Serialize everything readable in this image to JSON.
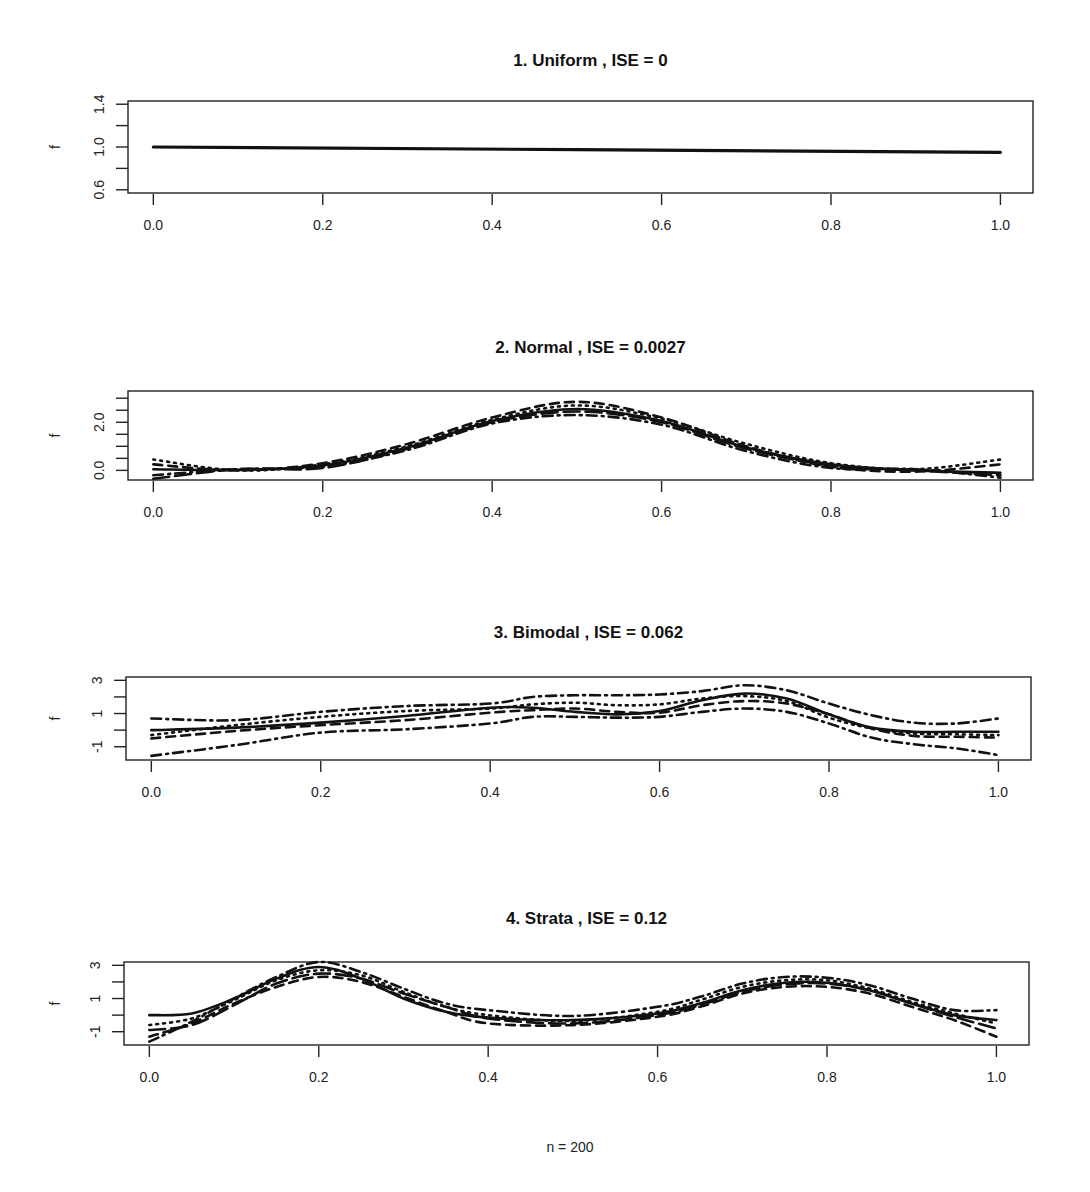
{
  "figure": {
    "footer": "n  =  200",
    "colors": {
      "line": "#111111",
      "frame": "#222222",
      "background": "#ffffff"
    }
  },
  "chart_data": [
    {
      "type": "line",
      "title": "1.  Uniform ,   ISE =  0",
      "name": "Uniform",
      "ise": "0",
      "xlabel": "",
      "ylabel": "f",
      "xlim": [
        0,
        1
      ],
      "ylim": [
        0.57,
        1.43
      ],
      "xticks": [
        0.0,
        0.2,
        0.4,
        0.6,
        0.8,
        1.0
      ],
      "xtick_labels": [
        "0.0",
        "0.2",
        "0.4",
        "0.6",
        "0.8",
        "1.0"
      ],
      "yticks": [
        0.6,
        0.8,
        1.0,
        1.2,
        1.4
      ],
      "ytick_labels": [
        "0.6",
        "",
        "1.0",
        "",
        "1.4"
      ],
      "grid": false,
      "series": [
        {
          "name": "true density",
          "style": "solid",
          "width": 3.2,
          "x": [
            0,
            1
          ],
          "y": [
            1.0,
            0.95
          ]
        }
      ]
    },
    {
      "type": "line",
      "title": "2.  Normal ,   ISE =  0.0027",
      "name": "Normal",
      "ise": "0.0027",
      "xlabel": "",
      "ylabel": "f",
      "xlim": [
        0,
        1
      ],
      "ylim": [
        -0.4,
        3.3
      ],
      "xticks": [
        0.0,
        0.2,
        0.4,
        0.6,
        0.8,
        1.0
      ],
      "xtick_labels": [
        "0.0",
        "0.2",
        "0.4",
        "0.6",
        "0.8",
        "1.0"
      ],
      "yticks": [
        0.0,
        0.5,
        1.0,
        1.5,
        2.0,
        2.5,
        3.0
      ],
      "ytick_labels": [
        "0.0",
        "",
        "",
        "",
        "2.0",
        "",
        ""
      ],
      "grid": false,
      "series": [
        {
          "name": "true density",
          "style": "solid",
          "width": 2.6,
          "x": [
            0,
            0.1,
            0.2,
            0.3,
            0.4,
            0.5,
            0.6,
            0.7,
            0.8,
            0.9,
            1.0
          ],
          "y": [
            0.05,
            0.02,
            0.2,
            0.95,
            2.05,
            2.55,
            2.05,
            0.95,
            0.25,
            0.0,
            -0.1
          ]
        },
        {
          "name": "estimate 1",
          "style": "dash",
          "width": 2.6,
          "x": [
            0,
            0.1,
            0.2,
            0.3,
            0.4,
            0.5,
            0.6,
            0.7,
            0.8,
            0.9,
            1.0
          ],
          "y": [
            0.25,
            0.0,
            0.3,
            1.1,
            2.2,
            2.85,
            2.2,
            1.0,
            0.15,
            -0.05,
            0.25
          ]
        },
        {
          "name": "estimate 2",
          "style": "dashdot",
          "width": 2.6,
          "x": [
            0,
            0.1,
            0.2,
            0.3,
            0.4,
            0.5,
            0.6,
            0.7,
            0.8,
            0.9,
            1.0
          ],
          "y": [
            -0.2,
            0.05,
            0.15,
            0.85,
            1.95,
            2.3,
            1.9,
            0.8,
            0.1,
            0.05,
            -0.3
          ]
        },
        {
          "name": "estimate 3",
          "style": "dot",
          "width": 2.6,
          "x": [
            0,
            0.1,
            0.2,
            0.3,
            0.4,
            0.5,
            0.6,
            0.7,
            0.8,
            0.9,
            1.0
          ],
          "y": [
            0.45,
            0.0,
            0.25,
            1.0,
            2.1,
            2.7,
            2.15,
            1.1,
            0.3,
            0.05,
            0.45
          ]
        },
        {
          "name": "estimate 4",
          "style": "longdash",
          "width": 2.6,
          "x": [
            0,
            0.1,
            0.2,
            0.3,
            0.4,
            0.5,
            0.6,
            0.7,
            0.8,
            0.9,
            1.0
          ],
          "y": [
            -0.35,
            0.05,
            0.1,
            0.9,
            2.0,
            2.45,
            2.0,
            0.9,
            0.2,
            0.0,
            -0.2
          ]
        }
      ]
    },
    {
      "type": "line",
      "title": "3.  Bimodal ,   ISE =  0.062",
      "name": "Bimodal",
      "ise": "0.062",
      "xlabel": "",
      "ylabel": "f",
      "xlim": [
        0,
        1
      ],
      "ylim": [
        -1.8,
        3.2
      ],
      "xticks": [
        0.0,
        0.2,
        0.4,
        0.6,
        0.8,
        1.0
      ],
      "xtick_labels": [
        "0.0",
        "0.2",
        "0.4",
        "0.6",
        "0.8",
        "1.0"
      ],
      "yticks": [
        -1,
        0,
        1,
        2,
        3
      ],
      "ytick_labels": [
        "-1",
        "",
        "1",
        "",
        "3"
      ],
      "grid": false,
      "series": [
        {
          "name": "true density",
          "style": "solid",
          "width": 2.6,
          "x": [
            0,
            0.1,
            0.2,
            0.3,
            0.4,
            0.45,
            0.5,
            0.55,
            0.6,
            0.65,
            0.7,
            0.75,
            0.8,
            0.85,
            0.9,
            0.95,
            1.0
          ],
          "y": [
            0.0,
            0.15,
            0.45,
            0.85,
            1.35,
            1.35,
            1.1,
            0.95,
            1.15,
            1.8,
            2.2,
            1.9,
            0.95,
            0.15,
            -0.1,
            -0.1,
            -0.1
          ]
        },
        {
          "name": "estimate 1",
          "style": "dashdot",
          "width": 2.6,
          "x": [
            0,
            0.1,
            0.2,
            0.3,
            0.4,
            0.45,
            0.5,
            0.55,
            0.6,
            0.65,
            0.7,
            0.75,
            0.8,
            0.85,
            0.9,
            0.95,
            1.0
          ],
          "y": [
            0.7,
            0.6,
            1.1,
            1.45,
            1.6,
            2.0,
            2.1,
            2.1,
            2.15,
            2.35,
            2.7,
            2.4,
            1.6,
            0.9,
            0.45,
            0.4,
            0.7
          ]
        },
        {
          "name": "estimate 2",
          "style": "dashdot",
          "width": 2.6,
          "x": [
            0,
            0.1,
            0.2,
            0.3,
            0.4,
            0.45,
            0.5,
            0.55,
            0.6,
            0.65,
            0.7,
            0.75,
            0.8,
            0.85,
            0.9,
            0.95,
            1.0
          ],
          "y": [
            -1.55,
            -0.9,
            -0.15,
            0.05,
            0.4,
            0.8,
            0.8,
            0.75,
            0.8,
            1.1,
            1.3,
            1.1,
            0.4,
            -0.45,
            -0.85,
            -1.1,
            -1.5
          ]
        },
        {
          "name": "estimate 3",
          "style": "dot",
          "width": 2.6,
          "x": [
            0,
            0.1,
            0.2,
            0.3,
            0.4,
            0.45,
            0.5,
            0.55,
            0.6,
            0.65,
            0.7,
            0.75,
            0.8,
            0.85,
            0.9,
            0.95,
            1.0
          ],
          "y": [
            -0.3,
            0.3,
            0.8,
            1.15,
            1.3,
            1.55,
            1.65,
            1.5,
            1.55,
            1.9,
            2.05,
            1.75,
            0.75,
            0.1,
            -0.2,
            -0.25,
            -0.3
          ]
        },
        {
          "name": "estimate 4",
          "style": "dash",
          "width": 2.6,
          "x": [
            0,
            0.1,
            0.2,
            0.3,
            0.4,
            0.45,
            0.5,
            0.55,
            0.6,
            0.65,
            0.7,
            0.75,
            0.8,
            0.85,
            0.9,
            0.95,
            1.0
          ],
          "y": [
            -0.5,
            -0.05,
            0.3,
            0.6,
            1.05,
            1.2,
            1.3,
            1.1,
            1.05,
            1.5,
            1.75,
            1.6,
            0.95,
            0.1,
            -0.35,
            -0.4,
            -0.45
          ]
        }
      ]
    },
    {
      "type": "line",
      "title": "4.  Strata ,   ISE =  0.12",
      "name": "Strata",
      "ise": "0.12",
      "xlabel": "",
      "ylabel": "f",
      "xlim": [
        0,
        1
      ],
      "ylim": [
        -1.8,
        3.2
      ],
      "xticks": [
        0.0,
        0.2,
        0.4,
        0.6,
        0.8,
        1.0
      ],
      "xtick_labels": [
        "0.0",
        "0.2",
        "0.4",
        "0.6",
        "0.8",
        "1.0"
      ],
      "yticks": [
        -1,
        0,
        1,
        2,
        3
      ],
      "ytick_labels": [
        "-1",
        "",
        "1",
        "",
        "3"
      ],
      "grid": false,
      "series": [
        {
          "name": "true density",
          "style": "solid",
          "width": 2.6,
          "x": [
            0,
            0.05,
            0.1,
            0.15,
            0.2,
            0.25,
            0.3,
            0.35,
            0.4,
            0.5,
            0.6,
            0.65,
            0.7,
            0.75,
            0.8,
            0.85,
            0.9,
            0.95,
            1.0
          ],
          "y": [
            0.0,
            0.1,
            1.0,
            2.2,
            2.9,
            2.2,
            1.0,
            0.2,
            -0.15,
            -0.3,
            0.1,
            0.7,
            1.5,
            1.95,
            1.95,
            1.5,
            0.7,
            0.0,
            -0.3
          ]
        },
        {
          "name": "estimate 1",
          "style": "dashdot",
          "width": 2.6,
          "x": [
            0,
            0.05,
            0.1,
            0.15,
            0.2,
            0.25,
            0.3,
            0.35,
            0.4,
            0.5,
            0.6,
            0.65,
            0.7,
            0.75,
            0.8,
            0.85,
            0.9,
            0.95,
            1.0
          ],
          "y": [
            -1.6,
            -0.4,
            1.0,
            2.3,
            3.2,
            2.6,
            1.6,
            0.7,
            0.3,
            -0.05,
            0.5,
            1.1,
            1.9,
            2.3,
            2.25,
            1.8,
            1.0,
            0.3,
            0.3
          ]
        },
        {
          "name": "estimate 2",
          "style": "dash",
          "width": 2.6,
          "x": [
            0,
            0.05,
            0.1,
            0.15,
            0.2,
            0.25,
            0.3,
            0.35,
            0.4,
            0.5,
            0.6,
            0.65,
            0.7,
            0.75,
            0.8,
            0.85,
            0.9,
            0.95,
            1.0
          ],
          "y": [
            -1.3,
            -0.5,
            0.7,
            1.7,
            2.3,
            2.0,
            1.1,
            0.2,
            -0.5,
            -0.6,
            -0.1,
            0.5,
            1.3,
            1.7,
            1.7,
            1.3,
            0.5,
            -0.3,
            -1.3
          ]
        },
        {
          "name": "estimate 3",
          "style": "dot",
          "width": 2.6,
          "x": [
            0,
            0.05,
            0.1,
            0.15,
            0.2,
            0.25,
            0.3,
            0.35,
            0.4,
            0.5,
            0.6,
            0.65,
            0.7,
            0.75,
            0.8,
            0.85,
            0.9,
            0.95,
            1.0
          ],
          "y": [
            -0.6,
            -0.2,
            0.9,
            2.1,
            2.7,
            2.4,
            1.4,
            0.5,
            0.0,
            -0.35,
            0.2,
            0.9,
            1.7,
            2.1,
            2.1,
            1.6,
            0.8,
            0.1,
            -0.5
          ]
        },
        {
          "name": "estimate 4",
          "style": "longdash",
          "width": 2.6,
          "x": [
            0,
            0.05,
            0.1,
            0.15,
            0.2,
            0.25,
            0.3,
            0.35,
            0.4,
            0.5,
            0.6,
            0.65,
            0.7,
            0.75,
            0.8,
            0.85,
            0.9,
            0.95,
            1.0
          ],
          "y": [
            -0.9,
            -0.6,
            0.6,
            1.9,
            2.5,
            2.2,
            1.3,
            0.5,
            -0.2,
            -0.5,
            0.0,
            0.6,
            1.4,
            1.85,
            1.9,
            1.5,
            0.7,
            -0.1,
            -0.8
          ]
        }
      ]
    }
  ]
}
